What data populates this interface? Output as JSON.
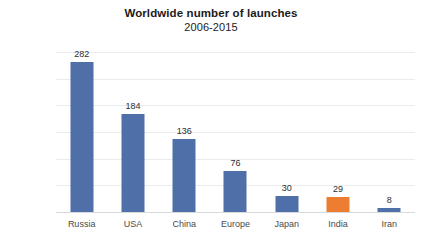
{
  "chart_data": {
    "type": "bar",
    "title": "Worldwide number of launches",
    "subtitle": "2006-2015",
    "xlabel": "",
    "ylabel": "",
    "categories": [
      "Russia",
      "USA",
      "China",
      "Europe",
      "Japan",
      "India",
      "Iran"
    ],
    "values": [
      282,
      184,
      136,
      76,
      30,
      29,
      8
    ],
    "value_labels": [
      "282",
      "184",
      "136",
      "76",
      "30",
      "29",
      "8"
    ],
    "ylim": [
      0,
      300
    ],
    "yticks": [
      300,
      250,
      200,
      150,
      100,
      50,
      0
    ],
    "ytick_labels": [
      "300",
      "250",
      "200",
      "150",
      "100",
      "50",
      "0"
    ],
    "grid": true,
    "legend": "none",
    "bar_colors": [
      "#4f6fa8",
      "#4f6fa8",
      "#4f6fa8",
      "#4f6fa8",
      "#4f6fa8",
      "#ed7d31",
      "#4f6fa8"
    ],
    "series": [
      {
        "name": "Number of launches",
        "values": [
          282,
          184,
          136,
          76,
          30,
          29,
          8
        ]
      }
    ]
  },
  "colors": {
    "bar_primary": "#4f6fa8",
    "bar_accent": "#ed7d31",
    "gridline": "#e9ebee",
    "baseline": "#d6d9dd",
    "title_text": "#1b1b1b",
    "tick_text": "#5b5b5b",
    "label_text": "#4a4a4a",
    "value_text": "#2e2e2e",
    "background": "#ffffff"
  }
}
